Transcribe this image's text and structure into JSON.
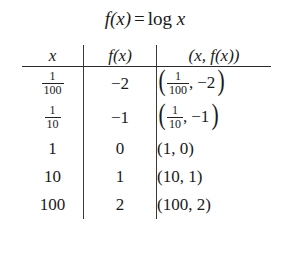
{
  "document": {
    "type": "math-table",
    "title": {
      "function_name": "f(x)",
      "equals": "=",
      "expression": "log",
      "argument": "x",
      "full_text": "f(x) = log x"
    },
    "table": {
      "columns": [
        {
          "key": "x",
          "header": "x",
          "align": "center"
        },
        {
          "key": "fx",
          "header": "f(x)",
          "align": "center"
        },
        {
          "key": "pair",
          "header": "(x, f(x))",
          "align": "center"
        }
      ],
      "rows": [
        {
          "x_display": "1/100",
          "x_numerator": "1",
          "x_denominator": "100",
          "x_is_fraction": true,
          "fx": "−2",
          "pair_left_numerator": "1",
          "pair_left_denominator": "100",
          "pair_right": "−2",
          "pair_display": "(1/100, −2)",
          "pair_has_fraction": true
        },
        {
          "x_display": "1/10",
          "x_numerator": "1",
          "x_denominator": "10",
          "x_is_fraction": true,
          "fx": "−1",
          "pair_left_numerator": "1",
          "pair_left_denominator": "10",
          "pair_right": "−1",
          "pair_display": "(1/10, −1)",
          "pair_has_fraction": true
        },
        {
          "x_display": "1",
          "x_is_fraction": false,
          "fx": "0",
          "pair_left": "1",
          "pair_right": "0",
          "pair_display": "(1, 0)",
          "pair_has_fraction": false
        },
        {
          "x_display": "10",
          "x_is_fraction": false,
          "fx": "1",
          "pair_left": "10",
          "pair_right": "1",
          "pair_display": "(10, 1)",
          "pair_has_fraction": false
        },
        {
          "x_display": "100",
          "x_is_fraction": false,
          "fx": "2",
          "pair_left": "100",
          "pair_right": "2",
          "pair_display": "(100, 2)",
          "pair_has_fraction": false
        }
      ]
    },
    "symbols": {
      "comma": ",",
      "paren_open": "(",
      "paren_close": ")"
    },
    "colors": {
      "background": "#ffffff",
      "text": "#1a1a1a",
      "rule": "#2b2b2b",
      "divider": "#3a3a3a"
    }
  }
}
